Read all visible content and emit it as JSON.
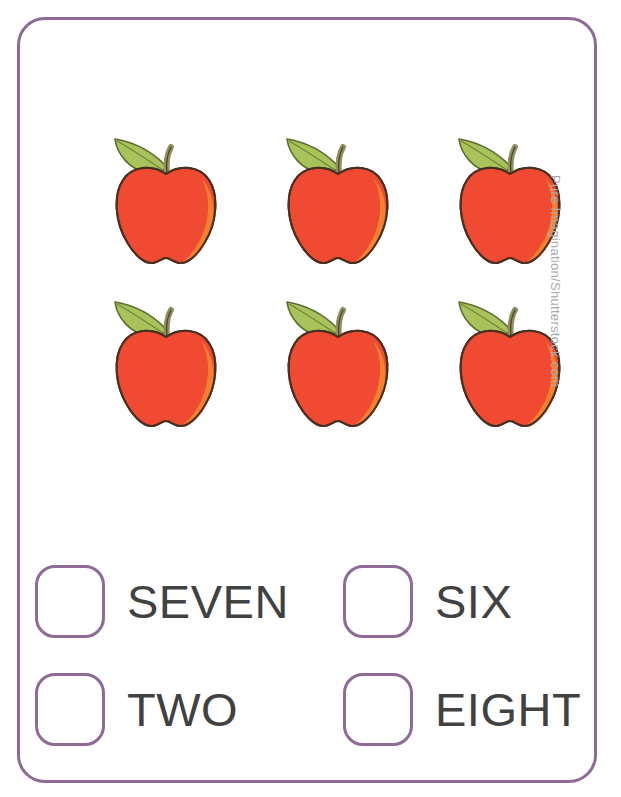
{
  "worksheet": {
    "type": "counting-worksheet",
    "border_color": "#8d6b96",
    "background_color": "#ffffff"
  },
  "objects": {
    "item_name": "apple",
    "count": 6,
    "rows": 2,
    "columns": 3,
    "body_color": "#f04a32",
    "shade_color": "#f5812f",
    "outline_color": "#4a3020",
    "leaf_color": "#a8c35a",
    "leaf_outline_color": "#5f6b2f",
    "stem_color": "#8e9160",
    "items": [
      {
        "index": 1,
        "label": "apple"
      },
      {
        "index": 2,
        "label": "apple"
      },
      {
        "index": 3,
        "label": "apple"
      },
      {
        "index": 4,
        "label": "apple"
      },
      {
        "index": 5,
        "label": "apple"
      },
      {
        "index": 6,
        "label": "apple"
      }
    ]
  },
  "answers": {
    "text_color": "#414141",
    "options": [
      {
        "id": "seven",
        "label": "SEVEN",
        "checked": false
      },
      {
        "id": "six",
        "label": "SIX",
        "checked": false
      },
      {
        "id": "two",
        "label": "TWO",
        "checked": false
      },
      {
        "id": "eight",
        "label": "EIGHT",
        "checked": false
      }
    ]
  },
  "watermark": {
    "text": "Pure Imagination/Shutterstock.com",
    "color": "#aaaaaa"
  }
}
